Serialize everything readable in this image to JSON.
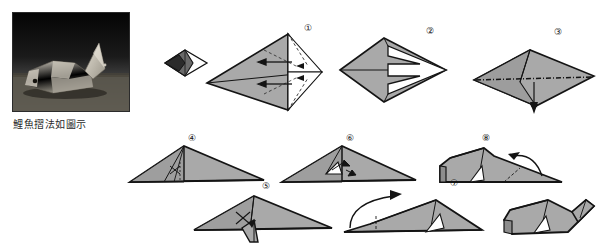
{
  "page": {
    "title": "鯉魚摺法如圖示",
    "width": 605,
    "height": 247,
    "background": "#ffffff",
    "ink_color": "#1a1a1a",
    "paper_fill": "#a9a9a9",
    "paper_fill_dark": "#8a8a8a",
    "paper_fill_light": "#c4c4c4"
  },
  "photo": {
    "name": "finished-carp-photograph",
    "caption": "鯉魚摺法如圖示",
    "subject": "folded paper carp",
    "background_color": "#101010",
    "model_color": "#b9b4aa",
    "border_color": "#2b2b2b"
  },
  "steps": [
    {
      "id": "step-pre",
      "label": "",
      "name": "preliminary-kite-small",
      "description": "small dark kite base seen edge-on"
    },
    {
      "id": "step-1",
      "label": "①",
      "name": "step-1-kite-base",
      "description": "large kite base with valley folds, two straight arrows pointing inward"
    },
    {
      "id": "step-2",
      "label": "②",
      "name": "step-2-arrow-flaps",
      "description": "flaps folded back forming arrow shaped notches"
    },
    {
      "id": "step-3",
      "label": "③",
      "name": "step-3-flatten-diamond",
      "description": "diamond flattened, dash-dot horizontal fold line, downward arrow"
    },
    {
      "id": "step-4",
      "label": "④",
      "name": "step-4-wide-triangle",
      "description": "folded to wide triangle with short inner crease marks"
    },
    {
      "id": "step-5",
      "label": "⑤",
      "name": "step-5-tail-pulled-down",
      "description": "triangle with tail flap pulled down at centre"
    },
    {
      "id": "step-6",
      "label": "⑥",
      "name": "step-6-inside-reverse",
      "description": "inside reverse fold at centre with small arrows"
    },
    {
      "id": "step-7",
      "label": "⑦",
      "name": "step-7-fold-over",
      "description": "long triangle, curved arrow at left indicating fold over"
    },
    {
      "id": "step-8",
      "label": "⑧",
      "name": "step-8-shape-body",
      "description": "three dimensional body with curved arrow at right for tail"
    },
    {
      "id": "step-final",
      "label": "",
      "name": "finished-carp-figure",
      "description": "completed carp with raised tail"
    }
  ]
}
